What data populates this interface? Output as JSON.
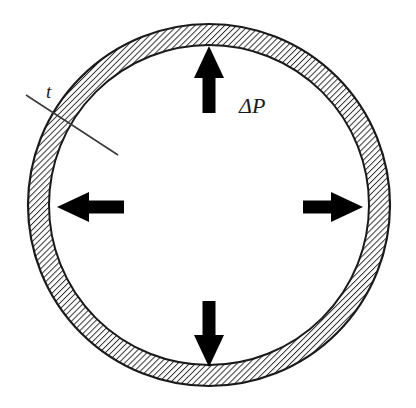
{
  "figure": {
    "background_color": "#ffffff",
    "line_color": "#1a1a1a",
    "hatch_color": "#2b2b2b",
    "arrow_color": "#000000"
  },
  "labels": {
    "thickness": "t",
    "pressure": "ΔP"
  },
  "geometry": {
    "center_x": 209,
    "center_y": 205,
    "outer_radius": 181,
    "inner_radius": 160,
    "hatch_angle_deg": 45,
    "hatch_spacing": 4
  },
  "arrows": [
    {
      "name": "arrow-up",
      "direction": "up",
      "tip_x": 209,
      "tip_y": 46,
      "tail_x": 209,
      "tail_y": 113
    },
    {
      "name": "arrow-down",
      "direction": "down",
      "tip_x": 209,
      "tip_y": 367,
      "tail_x": 209,
      "tail_y": 301
    },
    {
      "name": "arrow-left",
      "direction": "left",
      "tip_x": 57,
      "tip_y": 207,
      "tail_x": 124,
      "tail_y": 207
    },
    {
      "name": "arrow-right",
      "direction": "right",
      "tip_x": 363,
      "tip_y": 207,
      "tail_x": 303,
      "tail_y": 207
    }
  ],
  "leader_line": {
    "name": "thickness-leader-line",
    "x1": 26,
    "y1": 95,
    "x2": 118,
    "y2": 155
  },
  "label_positions": {
    "thickness": {
      "x": 46,
      "y": 98
    },
    "pressure": {
      "x": 239,
      "y": 113
    }
  }
}
